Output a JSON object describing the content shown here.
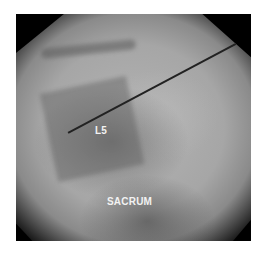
{
  "image": {
    "type": "fluoroscopic x-ray",
    "labels": {
      "l5": "L5",
      "sacrum": "SACRUM"
    }
  }
}
